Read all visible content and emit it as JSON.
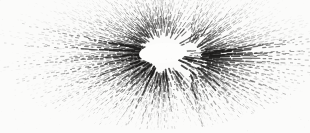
{
  "figure": {
    "caption": "Scanned monochrome illustration of a radiating starburst structure with a blank elliptical core and stippled rays fading toward the margins.",
    "medium": "halftone-scan",
    "type": "radial-burst",
    "background_color": "#fbfbfa",
    "ink_color": "#1d1c1b",
    "canvas": {
      "width": 310,
      "height": 133
    }
  },
  "chart_data": {
    "type": "scatter",
    "subtitle": "",
    "xlabel": "",
    "ylabel": "",
    "xlim": [
      0,
      310
    ],
    "ylim": [
      0,
      133
    ],
    "grid": false,
    "legend": "none",
    "focus": {
      "x": 163,
      "y": 53
    },
    "secondary_focus": {
      "x": 184,
      "y": 57
    },
    "core_void": {
      "cx": 163,
      "cy": 53,
      "rx": 24,
      "ry": 10,
      "rotation_deg": -4,
      "fill": "#fdfdfc"
    },
    "envelope": {
      "shape": "ellipse",
      "cx": 156,
      "cy": 50,
      "rx": 162,
      "ry": 80,
      "rotation_deg": -2,
      "clipped_top": true,
      "clipped_left": true,
      "clipped_right": true
    },
    "ray_count": 264,
    "ray_params": {
      "inner_radius_min": 16,
      "inner_radius_max": 30,
      "outer_radius_base": 150,
      "dash_len_min": 1.0,
      "dash_len_max": 7.5,
      "gap_min": 0.6,
      "gap_max": 4.0,
      "width_min": 0.45,
      "width_max": 1.5,
      "opacity_core": 0.92,
      "opacity_edge": 0.05
    },
    "sector_weights": [
      {
        "name": "upper-left",
        "start_deg": 180,
        "end_deg": 270,
        "solidity": 0.88,
        "density": 1.0,
        "darkness": 1.0
      },
      {
        "name": "upper-right",
        "start_deg": 270,
        "end_deg": 360,
        "solidity": 0.72,
        "density": 0.95,
        "darkness": 0.92
      },
      {
        "name": "lower-right",
        "start_deg": 0,
        "end_deg": 90,
        "solidity": 0.28,
        "density": 0.85,
        "darkness": 0.68
      },
      {
        "name": "lower-left",
        "start_deg": 90,
        "end_deg": 180,
        "solidity": 0.44,
        "density": 0.9,
        "darkness": 0.8
      }
    ],
    "heavy_ray_angles_deg": [
      188,
      193,
      199,
      205,
      212,
      219,
      226,
      234,
      241,
      248,
      255,
      262,
      268,
      274,
      281,
      288,
      296,
      303,
      311,
      318,
      326,
      334,
      341,
      349,
      356,
      4,
      11,
      172,
      178,
      183
    ],
    "stipple_cloud": {
      "count": 900,
      "radius_min": 34,
      "radius_max": 152,
      "dot_size_min": 0.4,
      "dot_size_max": 1.35,
      "bias": "lower-hemisphere"
    },
    "series": [
      {
        "name": "solid rays",
        "values": [
          88,
          72,
          28,
          44
        ],
        "categories": [
          "upper-left",
          "upper-right",
          "lower-right",
          "lower-left"
        ]
      },
      {
        "name": "stipple density",
        "values": [
          100,
          95,
          85,
          90
        ],
        "categories": [
          "upper-left",
          "upper-right",
          "lower-right",
          "lower-left"
        ]
      }
    ]
  }
}
